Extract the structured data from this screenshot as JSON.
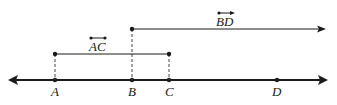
{
  "diagram": {
    "title": "",
    "points": [
      {
        "label": "A",
        "x": 55
      },
      {
        "label": "B",
        "x": 132
      },
      {
        "label": "C",
        "x": 169
      },
      {
        "label": "D",
        "x": 277
      }
    ],
    "segment": {
      "notation": "AC",
      "symbol": "segment",
      "from": "A",
      "to": "C"
    },
    "ray": {
      "notation": "BD",
      "symbol": "ray",
      "from": "B",
      "through": "D"
    },
    "colors": {
      "ink": "#1a1a1a"
    }
  }
}
